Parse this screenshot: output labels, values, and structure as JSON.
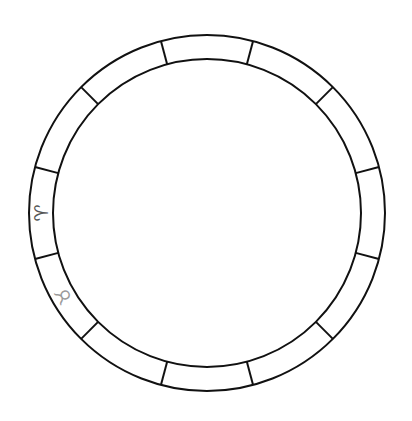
{
  "wheel": {
    "center": [
      207,
      213
    ],
    "outer_radius": 178,
    "inner_radius": 154,
    "stroke_color": "#111111",
    "stroke_width": 2,
    "segment_count": 12,
    "divider_offset_deg": 15
  },
  "signs": [
    {
      "name": "aries",
      "glyph": "♈",
      "angle_deg": 270,
      "color": "#555555"
    },
    {
      "name": "taurus",
      "glyph": "♉",
      "angle_deg": 240,
      "color": "#9a9a9a"
    }
  ]
}
